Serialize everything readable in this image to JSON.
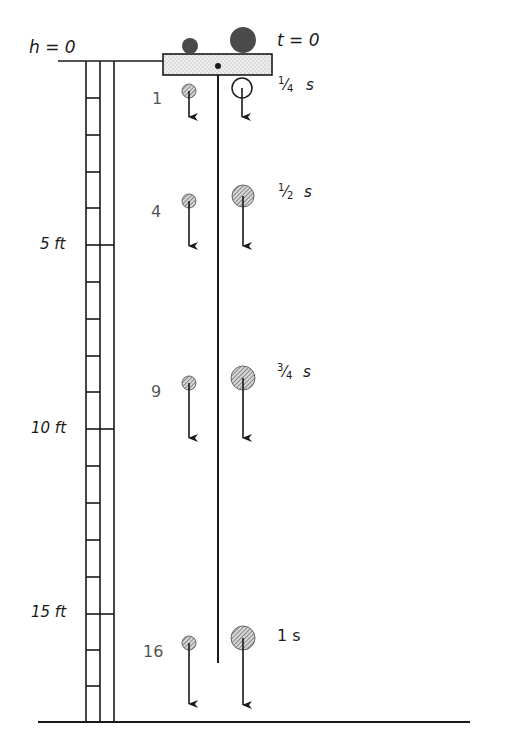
{
  "diagram": {
    "height_origin_label": "h = 0",
    "time_origin_label": "t = 0",
    "scale": {
      "unit": "ft",
      "pixels_per_ft": 36.8,
      "ticks": [
        {
          "label": "5 ft",
          "value": 5
        },
        {
          "label": "10 ft",
          "value": 10
        },
        {
          "label": "15 ft",
          "value": 15
        }
      ]
    },
    "time_steps": [
      {
        "time_label": "1/4 s",
        "num": "1",
        "den": "4",
        "unit": "s",
        "distance_units": "1"
      },
      {
        "time_label": "1/2 s",
        "num": "1",
        "den": "2",
        "unit": "s",
        "distance_units": "4"
      },
      {
        "time_label": "3/4 s",
        "num": "3",
        "den": "4",
        "unit": "s",
        "distance_units": "9"
      },
      {
        "time_label": "1 s",
        "unit": "s",
        "distance_units": "16"
      }
    ],
    "objects": {
      "small_ball": "small ball (lighter)",
      "large_ball": "large ball (heavier)",
      "platform": "release platform",
      "pole": "vertical guide pole",
      "ladder": "height ladder",
      "ground": "ground line"
    },
    "colors": {
      "ink": "#1a1a1a",
      "ball_dark": "#4a4a4a",
      "ball_hatch": "#8a8a8a",
      "platform_fill": "#e4e4e4"
    }
  }
}
